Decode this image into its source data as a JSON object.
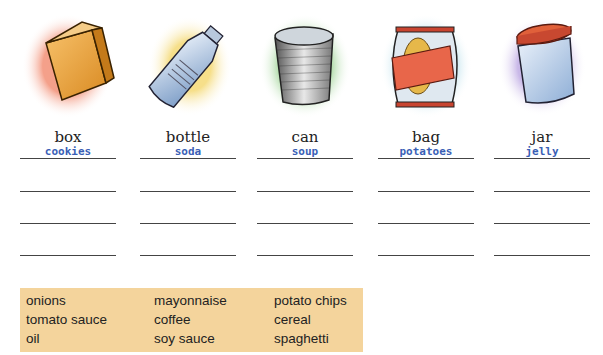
{
  "containers": [
    {
      "label": "box",
      "answer": "cookies",
      "icon": "box-icon",
      "glow": "#f4a08a"
    },
    {
      "label": "bottle",
      "answer": "soda",
      "icon": "bottle-icon",
      "glow": "#f6df8a"
    },
    {
      "label": "can",
      "answer": "soup",
      "icon": "can-icon",
      "glow": "#a8d8a0"
    },
    {
      "label": "bag",
      "answer": "potatoes",
      "icon": "bag-icon",
      "glow": "#a9d8e6"
    },
    {
      "label": "jar",
      "answer": "jelly",
      "icon": "jar-icon",
      "glow": "#c9b8e8"
    }
  ],
  "word_box": {
    "columns": [
      [
        "onions",
        "tomato sauce",
        "oil"
      ],
      [
        "mayonnaise",
        "coffee",
        "soy sauce"
      ],
      [
        "potato chips",
        "cereal",
        "spaghetti"
      ]
    ],
    "background": "#f4d49c"
  },
  "answer_color": "#3a5fb6"
}
